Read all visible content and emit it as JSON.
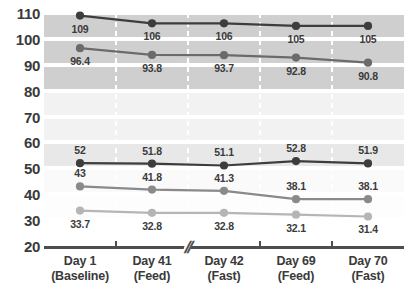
{
  "chart_data": {
    "type": "line",
    "title": "",
    "subtitle": "",
    "xlabel": "",
    "ylabel": "",
    "ylim": [
      20,
      110
    ],
    "ytick_step": 10,
    "yticks": [
      110,
      100,
      90,
      80,
      70,
      60,
      50,
      40,
      30,
      20
    ],
    "grid": "horizontal-bands-and-vertical-dashed",
    "legend_position": "none",
    "axis_break_after_category_index": 1,
    "categories": [
      "Day 1\n(Baseline)",
      "Day 41\n(Feed)",
      "Day 42\n(Fast)",
      "Day 69\n(Feed)",
      "Day 70\n(Fast)"
    ],
    "category_lines": [
      {
        "line1": "Day 1",
        "line2": "(Baseline)"
      },
      {
        "line1": "Day 41",
        "line2": "(Feed)"
      },
      {
        "line1": "Day 42",
        "line2": "(Fast)"
      },
      {
        "line1": "Day 69",
        "line2": "(Feed)"
      },
      {
        "line1": "Day 70",
        "line2": "(Fast)"
      }
    ],
    "series": [
      {
        "name": "series-1",
        "color": "#3d3d3d",
        "values": [
          109,
          106,
          106,
          105,
          105
        ],
        "labels": [
          "109",
          "106",
          "106",
          "105",
          "105"
        ],
        "label_position": "below"
      },
      {
        "name": "series-2",
        "color": "#6b6b6b",
        "values": [
          96.4,
          93.8,
          93.7,
          92.8,
          90.8
        ],
        "labels": [
          "96.4",
          "93.8",
          "93.7",
          "92.8",
          "90.8"
        ],
        "label_position": "below"
      },
      {
        "name": "series-3",
        "color": "#3d3d3d",
        "values": [
          52,
          51.8,
          51.1,
          52.8,
          51.9
        ],
        "labels": [
          "52",
          "51.8",
          "51.1",
          "52.8",
          "51.9"
        ],
        "label_position": "above"
      },
      {
        "name": "series-4",
        "color": "#8a8a8a",
        "values": [
          43,
          41.8,
          41.3,
          38.1,
          38.1
        ],
        "labels": [
          "43",
          "41.8",
          "41.3",
          "38.1",
          "38.1"
        ],
        "label_position": "above"
      },
      {
        "name": "series-5",
        "color": "#b5b5b5",
        "values": [
          33.7,
          32.8,
          32.8,
          32.1,
          31.4
        ],
        "labels": [
          "33.7",
          "32.8",
          "32.8",
          "32.1",
          "31.4"
        ],
        "label_position": "below"
      }
    ],
    "band_colors": {
      "dark": "#cfcfcf",
      "light": "#e8e8e8",
      "lighter": "#f2f2f2",
      "white": "#ffffff"
    },
    "axis_color": "#4d4d4d",
    "axis_break_glyph": "//"
  }
}
